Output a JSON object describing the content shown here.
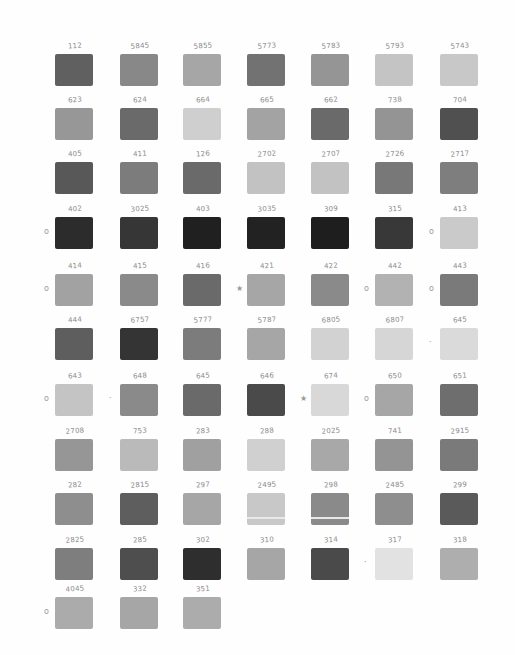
{
  "sheet": {
    "rows": [
      [
        {
          "label": "112",
          "color": "#606060"
        },
        {
          "label": "5845",
          "color": "#888888"
        },
        {
          "label": "5855",
          "color": "#a6a6a6"
        },
        {
          "label": "5773",
          "color": "#727272"
        },
        {
          "label": "5783",
          "color": "#959595"
        },
        {
          "label": "5793",
          "color": "#c4c4c4"
        },
        {
          "label": "5743",
          "color": "#c8c8c8"
        }
      ],
      [
        {
          "label": "623",
          "color": "#979797"
        },
        {
          "label": "624",
          "color": "#6a6a6a"
        },
        {
          "label": "664",
          "color": "#cfcfcf"
        },
        {
          "label": "665",
          "color": "#a3a3a3"
        },
        {
          "label": "662",
          "color": "#6a6a6a"
        },
        {
          "label": "738",
          "color": "#949494"
        },
        {
          "label": "704",
          "color": "#505050"
        }
      ],
      [
        {
          "label": "405",
          "color": "#585858"
        },
        {
          "label": "411",
          "color": "#7c7c7c"
        },
        {
          "label": "126",
          "color": "#6a6a6a"
        },
        {
          "label": "2702",
          "color": "#c2c2c2"
        },
        {
          "label": "2707",
          "color": "#c2c2c2"
        },
        {
          "label": "2726",
          "color": "#787878"
        },
        {
          "label": "2717",
          "color": "#7e7e7e"
        }
      ],
      [
        {
          "label": "402",
          "color": "#2c2c2c",
          "mark": "o"
        },
        {
          "label": "3025",
          "color": "#363636"
        },
        {
          "label": "403",
          "color": "#202020"
        },
        {
          "label": "3035",
          "color": "#222222"
        },
        {
          "label": "309",
          "color": "#1e1e1e"
        },
        {
          "label": "315",
          "color": "#383838"
        },
        {
          "label": "413",
          "color": "#cacaca",
          "mark": "o"
        }
      ],
      [
        {
          "label": "414",
          "color": "#a2a2a2",
          "mark": "o"
        },
        {
          "label": "415",
          "color": "#8a8a8a"
        },
        {
          "label": "416",
          "color": "#6a6a6a"
        },
        {
          "label": "421",
          "color": "#a6a6a6",
          "mark": "★"
        },
        {
          "label": "422",
          "color": "#8a8a8a"
        },
        {
          "label": "442",
          "color": "#b2b2b2",
          "mark": "o"
        },
        {
          "label": "443",
          "color": "#7a7a7a",
          "mark": "o"
        }
      ],
      [
        {
          "label": "444",
          "color": "#5e5e5e"
        },
        {
          "label": "6757",
          "color": "#343434"
        },
        {
          "label": "5777",
          "color": "#7c7c7c"
        },
        {
          "label": "5787",
          "color": "#a6a6a6"
        },
        {
          "label": "6805",
          "color": "#d2d2d2"
        },
        {
          "label": "6807",
          "color": "#d6d6d6"
        },
        {
          "label": "645",
          "color": "#dadada",
          "mark": "·"
        }
      ],
      [
        {
          "label": "643",
          "color": "#c4c4c4",
          "mark": "o"
        },
        {
          "label": "648",
          "color": "#8a8a8a",
          "mark": "·"
        },
        {
          "label": "645",
          "color": "#6a6a6a"
        },
        {
          "label": "646",
          "color": "#4a4a4a"
        },
        {
          "label": "674",
          "color": "#d8d8d8",
          "mark": "★"
        },
        {
          "label": "650",
          "color": "#a6a6a6",
          "mark": "o"
        },
        {
          "label": "651",
          "color": "#6e6e6e"
        }
      ],
      [
        {
          "label": "2708",
          "color": "#969696"
        },
        {
          "label": "753",
          "color": "#bababa"
        },
        {
          "label": "283",
          "color": "#a0a0a0"
        },
        {
          "label": "288",
          "color": "#d0d0d0"
        },
        {
          "label": "2025",
          "color": "#a8a8a8"
        },
        {
          "label": "741",
          "color": "#949494"
        },
        {
          "label": "2915",
          "color": "#7a7a7a"
        }
      ],
      [
        {
          "label": "282",
          "color": "#8e8e8e"
        },
        {
          "label": "2815",
          "color": "#5e5e5e"
        },
        {
          "label": "297",
          "color": "#a6a6a6"
        },
        {
          "label": "2495",
          "color": "#c8c8c8",
          "stripe": true
        },
        {
          "label": "298",
          "color": "#8a8a8a",
          "stripe": true
        },
        {
          "label": "2485",
          "color": "#8e8e8e"
        },
        {
          "label": "299",
          "color": "#5a5a5a"
        }
      ],
      [
        {
          "label": "2825",
          "color": "#7e7e7e"
        },
        {
          "label": "285",
          "color": "#4e4e4e"
        },
        {
          "label": "302",
          "color": "#2e2e2e"
        },
        {
          "label": "310",
          "color": "#a6a6a6"
        },
        {
          "label": "314",
          "color": "#4a4a4a"
        },
        {
          "label": "317",
          "color": "#e2e2e2",
          "mark": "·"
        },
        {
          "label": "318",
          "color": "#aeaeae"
        }
      ],
      [
        {
          "label": "4045",
          "color": "#ababab",
          "mark": "o"
        },
        {
          "label": "332",
          "color": "#a6a6a6"
        },
        {
          "label": "351",
          "color": "#acacac"
        }
      ]
    ],
    "columns_x": [
      55,
      120,
      183,
      247,
      311,
      375,
      440
    ],
    "rows_y": [
      42,
      96,
      150,
      205,
      262,
      316,
      372,
      427,
      481,
      536,
      585
    ]
  }
}
